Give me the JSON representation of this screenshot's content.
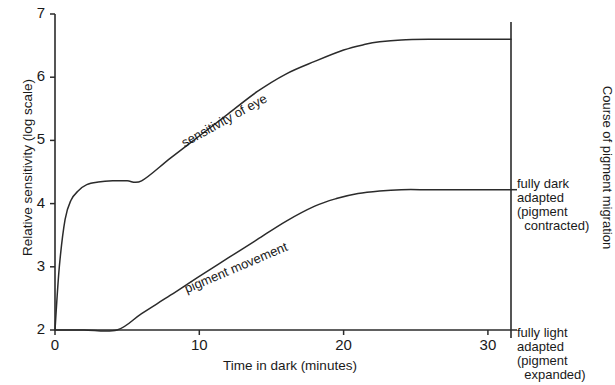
{
  "chart_data": {
    "type": "line",
    "title": "",
    "xlabel": "Time in dark (minutes)",
    "ylabel": "Relative sensitivity (log scale)",
    "right_axis_label": "Course of pigment migration",
    "xlim": [
      0,
      31.6
    ],
    "ylim": [
      2,
      7
    ],
    "xticks": [
      0,
      10,
      20,
      30
    ],
    "xtick_labels": [
      "0",
      "10",
      "20",
      "30"
    ],
    "yticks": [
      2,
      3,
      4,
      5,
      6,
      7
    ],
    "ytick_labels": [
      "2",
      "3",
      "4",
      "5",
      "6",
      "7"
    ],
    "grid": false,
    "legend": "inline-labels",
    "series": [
      {
        "name": "sensitivity of eye",
        "label_text": "sensitivity of eye",
        "x": [
          0,
          0.3,
          0.7,
          1.1,
          1.6,
          2.2,
          3.0,
          4.0,
          5.0,
          6.0,
          8.0,
          10.0,
          12.0,
          14.0,
          16.0,
          18.0,
          20.0,
          21.5,
          22.5,
          24.0,
          26.0,
          28.0,
          31.6
        ],
        "y": [
          2.0,
          3.0,
          3.75,
          4.05,
          4.2,
          4.3,
          4.34,
          4.36,
          4.36,
          4.36,
          4.72,
          5.07,
          5.42,
          5.77,
          6.05,
          6.25,
          6.43,
          6.52,
          6.56,
          6.59,
          6.6,
          6.6,
          6.6
        ]
      },
      {
        "name": "pigment movement",
        "label_text": "pigment movement",
        "x": [
          0,
          2.0,
          4.3,
          6.0,
          8.0,
          10.0,
          12.0,
          14.0,
          16.0,
          18.0,
          19.5,
          21.0,
          22.5,
          24.0,
          26.0,
          28.0,
          31.6
        ],
        "y": [
          2.0,
          2.0,
          2.0,
          2.26,
          2.55,
          2.85,
          3.14,
          3.43,
          3.72,
          3.96,
          4.08,
          4.16,
          4.2,
          4.22,
          4.22,
          4.22,
          4.22
        ]
      }
    ],
    "annotations": [
      {
        "name": "fully-dark-adapted",
        "value": 4.22,
        "lines": [
          "fully dark",
          "adapted",
          "(pigment",
          " contracted)"
        ]
      },
      {
        "name": "fully-light-adapted",
        "value": 2.0,
        "lines": [
          "fully light",
          "adapted",
          "(pigment",
          " expanded)"
        ]
      }
    ]
  },
  "axes": {
    "y_title": "Relative sensitivity (log scale)",
    "x_title": "Time in dark (minutes)",
    "right_title": "Course of pigment migration"
  },
  "labels": {
    "curve_sensitivity": "sensitivity of eye",
    "curve_pigment": "pigment movement"
  },
  "side_notes": {
    "dark": "fully dark\nadapted\n(pigment\n  contracted)",
    "light": "fully light\nadapted\n(pigment\n  expanded)"
  },
  "colors": {
    "ink": "#2b2b2b",
    "background": "#ffffff"
  }
}
